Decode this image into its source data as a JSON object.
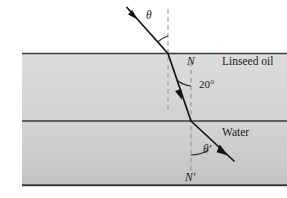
{
  "figure": {
    "type": "optics-ray-diagram",
    "width": 287,
    "height": 198,
    "background_color": "#ffffff"
  },
  "media": [
    {
      "key": "air",
      "label": "",
      "region": "above top surface",
      "fill_color": "#ffffff",
      "y_top": 0,
      "y_bottom": 53
    },
    {
      "key": "linseed_oil",
      "label": "Linseed oil",
      "region": "middle band",
      "fill_color": "#d6d6d6",
      "y_top": 53,
      "y_bottom": 121
    },
    {
      "key": "water",
      "label": "Water",
      "region": "lower band",
      "fill_color": "#cccccc",
      "y_top": 121,
      "y_bottom": 185
    }
  ],
  "labels": {
    "theta_incident": "θ",
    "normal_upper": "N",
    "angle_in_oil": "20°",
    "medium_oil": "Linseed oil",
    "medium_water": "Water",
    "theta_refracted": "θ′",
    "normal_lower": "N′"
  },
  "colors": {
    "line_dark": "#303030",
    "ray": "#111111",
    "dashed_normal": "#9a9a9a",
    "text": "#1a1a1a",
    "oil_fill": "#d6d6d6",
    "water_fill_top": "#d2d2d2",
    "water_fill_bottom": "#c4c4c4"
  },
  "geometry": {
    "surface_top_y": 53,
    "interface_oil_water_y": 121,
    "bottom_y": 185,
    "incidence_point": {
      "x": 168,
      "y": 53
    },
    "refraction_point": {
      "x": 191,
      "y": 121
    },
    "incident_ray_start": {
      "x": 127,
      "y": 8
    },
    "refracted_ray_end": {
      "x": 234,
      "y": 161
    },
    "normal_upper_x": 168,
    "normal_lower_x": 191
  },
  "angles": {
    "incident_angle_symbol": "θ",
    "oil_angle_value": "20°",
    "water_angle_symbol": "θ′"
  }
}
